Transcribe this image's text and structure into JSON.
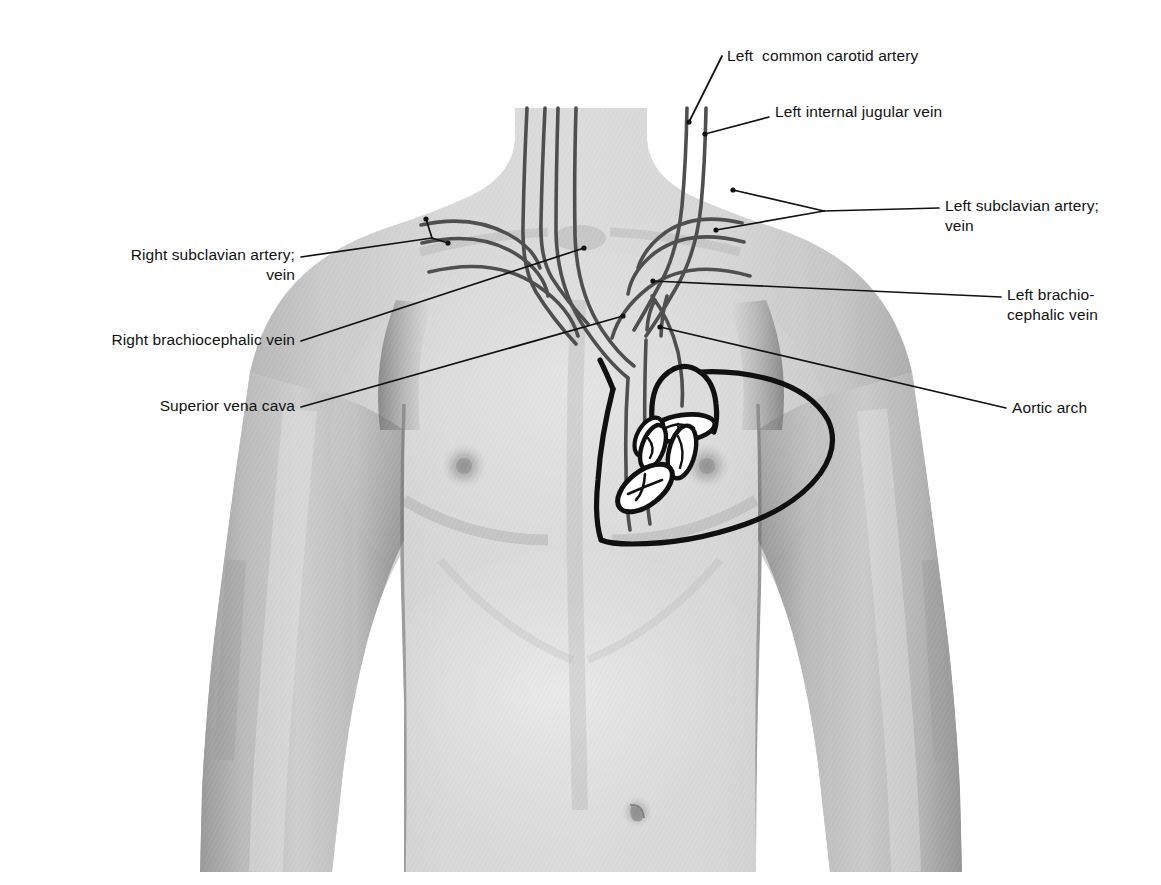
{
  "figure": {
    "title_alt": "Anterior thorax surface anatomy with great vessels and heart outline",
    "colors": {
      "background": "#ffffff",
      "skin_light": "#d8d8d8",
      "skin_mid": "#c3c3c3",
      "skin_shadow": "#a8a8a8",
      "skin_deep_shadow": "#8f8f8f",
      "vessel_line": "#4a4a4a",
      "heart_line": "#111111",
      "leader_line": "#111111",
      "label_text": "#111111"
    }
  },
  "labels": [
    {
      "id": "left-common-carotid-artery",
      "text": "Left  common carotid artery",
      "align": "left",
      "x": 727,
      "y": 54
    },
    {
      "id": "left-internal-jugular-vein",
      "text": "Left internal jugular vein",
      "align": "left",
      "x": 775,
      "y": 110
    },
    {
      "id": "left-subclavian-artery-vein",
      "text": "Left subclavian artery;\nvein",
      "align": "left",
      "x": 945,
      "y": 194
    },
    {
      "id": "left-brachiocephalic-vein",
      "text": "Left brachio-\ncephalic vein",
      "align": "left",
      "x": 1007,
      "y": 288
    },
    {
      "id": "aortic-arch",
      "text": "Aortic arch",
      "align": "left",
      "x": 1012,
      "y": 401
    },
    {
      "id": "right-subclavian-artery-vein",
      "text": "Right subclavian artery;\nvein",
      "align": "right",
      "x": 91,
      "y": 249,
      "width": 204
    },
    {
      "id": "right-brachiocephalic-vein",
      "text": "Right brachiocephalic vein",
      "align": "right",
      "x": 52,
      "y": 333,
      "width": 243
    },
    {
      "id": "superior-vena-cava",
      "text": "Superior vena cava",
      "align": "right",
      "x": 103,
      "y": 399,
      "width": 192
    }
  ],
  "structures": [
    {
      "id": "left-common-carotid-artery",
      "kind": "artery"
    },
    {
      "id": "left-internal-jugular-vein",
      "kind": "vein"
    },
    {
      "id": "right-common-carotid-artery",
      "kind": "artery"
    },
    {
      "id": "right-internal-jugular-vein",
      "kind": "vein"
    },
    {
      "id": "left-subclavian-artery",
      "kind": "artery"
    },
    {
      "id": "left-subclavian-vein",
      "kind": "vein"
    },
    {
      "id": "right-subclavian-artery",
      "kind": "artery"
    },
    {
      "id": "right-subclavian-vein",
      "kind": "vein"
    },
    {
      "id": "left-brachiocephalic-vein",
      "kind": "vein"
    },
    {
      "id": "right-brachiocephalic-vein",
      "kind": "vein"
    },
    {
      "id": "superior-vena-cava",
      "kind": "vein"
    },
    {
      "id": "aortic-arch",
      "kind": "artery"
    },
    {
      "id": "heart-outline",
      "kind": "organ"
    },
    {
      "id": "aortic-valve",
      "kind": "valve"
    },
    {
      "id": "pulmonary-valve",
      "kind": "valve"
    },
    {
      "id": "mitral-valve",
      "kind": "valve"
    },
    {
      "id": "tricuspid-valve",
      "kind": "valve"
    }
  ]
}
